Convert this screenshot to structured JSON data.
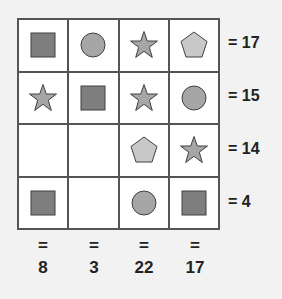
{
  "puzzle": {
    "grid": [
      [
        "square",
        "circle",
        "star",
        "pentagon"
      ],
      [
        "star",
        "square",
        "star",
        "circle"
      ],
      [
        "empty",
        "empty",
        "pentagon",
        "star"
      ],
      [
        "square",
        "empty",
        "circle",
        "square"
      ]
    ],
    "row_sums": [
      "= 17",
      "= 15",
      "= 14",
      "= 4"
    ],
    "col_equals": [
      "=",
      "=",
      "=",
      "="
    ],
    "col_sums": [
      "8",
      "3",
      "22",
      "17"
    ]
  },
  "colors": {
    "square": "#7f7f7f",
    "circle": "#a6a6a6",
    "star": "#a6a6a6",
    "pentagon": "#c8c8c8",
    "stroke": "#404040"
  }
}
